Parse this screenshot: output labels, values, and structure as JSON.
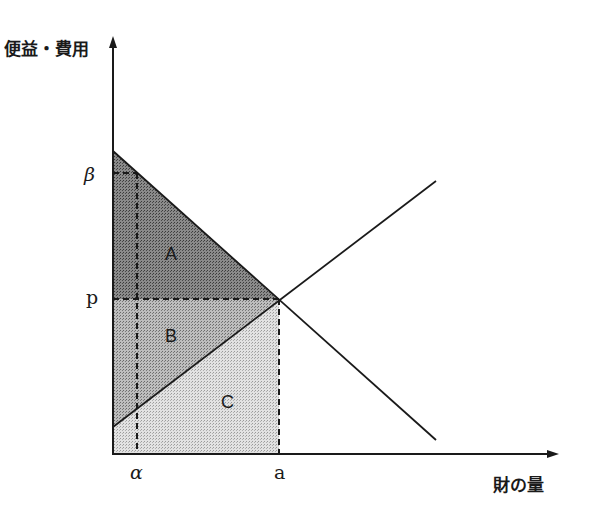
{
  "axes": {
    "y_label": "便益・費用",
    "x_label": "財の量"
  },
  "ticks": {
    "beta": "β",
    "p": "p",
    "alpha": "α",
    "a": "a"
  },
  "areas": {
    "A": "A",
    "B": "B",
    "C": "C"
  },
  "colors": {
    "area_A": "#6e6e6e",
    "area_B": "#a6a6a6",
    "area_C": "#d4d4d4",
    "lines": "#1a1a1a"
  }
}
